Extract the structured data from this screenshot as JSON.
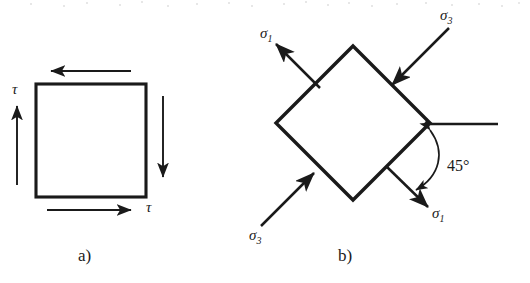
{
  "figure": {
    "background_color": "#ffffff",
    "ink_color": "#1a1a1a",
    "width": 530,
    "height": 283
  },
  "panels": [
    {
      "id": "a",
      "caption": "a)",
      "caption_x": 78,
      "caption_y": 247,
      "description": "Square element loaded in pure shear",
      "shape": "square",
      "square": {
        "x": 36,
        "y": 84,
        "width": 110,
        "height": 113
      },
      "labels": [
        {
          "name": "tau-left",
          "symbol": "τ",
          "sub": "",
          "x": 12,
          "y": 82
        },
        {
          "name": "tau-bottom",
          "symbol": "τ",
          "sub": "",
          "x": 146,
          "y": 200
        }
      ],
      "shear_arrows": [
        {
          "name": "shear-arrow-top",
          "direction": "left",
          "from_x": 131,
          "from_y": 71,
          "to_x": 51,
          "to_y": 71
        },
        {
          "name": "shear-arrow-bottom",
          "direction": "right",
          "from_x": 47,
          "from_y": 210,
          "to_x": 131,
          "to_y": 210
        },
        {
          "name": "shear-arrow-left",
          "direction": "up",
          "from_x": 17,
          "from_y": 185,
          "to_x": 17,
          "to_y": 106
        },
        {
          "name": "shear-arrow-right",
          "direction": "down",
          "from_x": 163,
          "from_y": 96,
          "to_x": 163,
          "to_y": 177
        }
      ]
    },
    {
      "id": "b",
      "caption": "b)",
      "caption_x": 338,
      "caption_y": 247,
      "description": "Rotated 45 degree element showing principal stresses sigma-1 tension and sigma-3 compression",
      "shape": "diamond",
      "diamond": {
        "center_x": 353,
        "center_y": 123,
        "half_diagonal": 77,
        "vertices": [
          {
            "name": "top",
            "x": 353,
            "y": 46
          },
          {
            "name": "right",
            "x": 430,
            "y": 123
          },
          {
            "name": "bottom",
            "x": 353,
            "y": 200
          },
          {
            "name": "left",
            "x": 276,
            "y": 123
          }
        ]
      },
      "reference_line": {
        "name": "horizontal-reference-line",
        "x1": 424,
        "y1": 124,
        "x2": 498,
        "y2": 124
      },
      "angle": {
        "name": "angle-45",
        "value": "45°",
        "label_x": 447,
        "label_y": 158,
        "arc_start_x": 430,
        "arc_start_y": 126,
        "arc_end_x": 412,
        "arc_end_y": 190
      },
      "stress_arrows": [
        {
          "name": "sigma1-arrow-upper-left",
          "symbol": "σ",
          "sub": "1",
          "sense": "tension-outward",
          "tail_x": 320,
          "tail_y": 88,
          "head_x": 276,
          "head_y": 44,
          "label_x": 260,
          "label_y": 26
        },
        {
          "name": "sigma1-arrow-lower-right",
          "symbol": "σ",
          "sub": "1",
          "sense": "tension-outward",
          "tail_x": 386,
          "tail_y": 166,
          "head_x": 428,
          "head_y": 207,
          "label_x": 432,
          "label_y": 206
        },
        {
          "name": "sigma3-arrow-upper-right",
          "symbol": "σ",
          "sub": "3",
          "sense": "compression-inward",
          "tail_x": 449,
          "tail_y": 28,
          "head_x": 392,
          "head_y": 85,
          "label_x": 440,
          "label_y": 8
        },
        {
          "name": "sigma3-arrow-lower-left",
          "symbol": "σ",
          "sub": "3",
          "sense": "compression-inward",
          "tail_x": 261,
          "tail_y": 226,
          "head_x": 314,
          "head_y": 173,
          "label_x": 249,
          "label_y": 228
        }
      ]
    }
  ]
}
